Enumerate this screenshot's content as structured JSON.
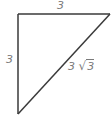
{
  "figure": {
    "type": "right-triangle",
    "stroke_color": "#3a3a3a",
    "label_color": "#7a7a7a",
    "vertices": {
      "top_left": [
        18,
        14
      ],
      "top_right": [
        110,
        14
      ],
      "bottom_left": [
        18,
        114
      ]
    },
    "labels": {
      "top_side": "3",
      "left_side": "3",
      "hypotenuse_coefficient": "3",
      "hypotenuse_sqrt_sign": "√",
      "hypotenuse_radicand": "3"
    }
  }
}
